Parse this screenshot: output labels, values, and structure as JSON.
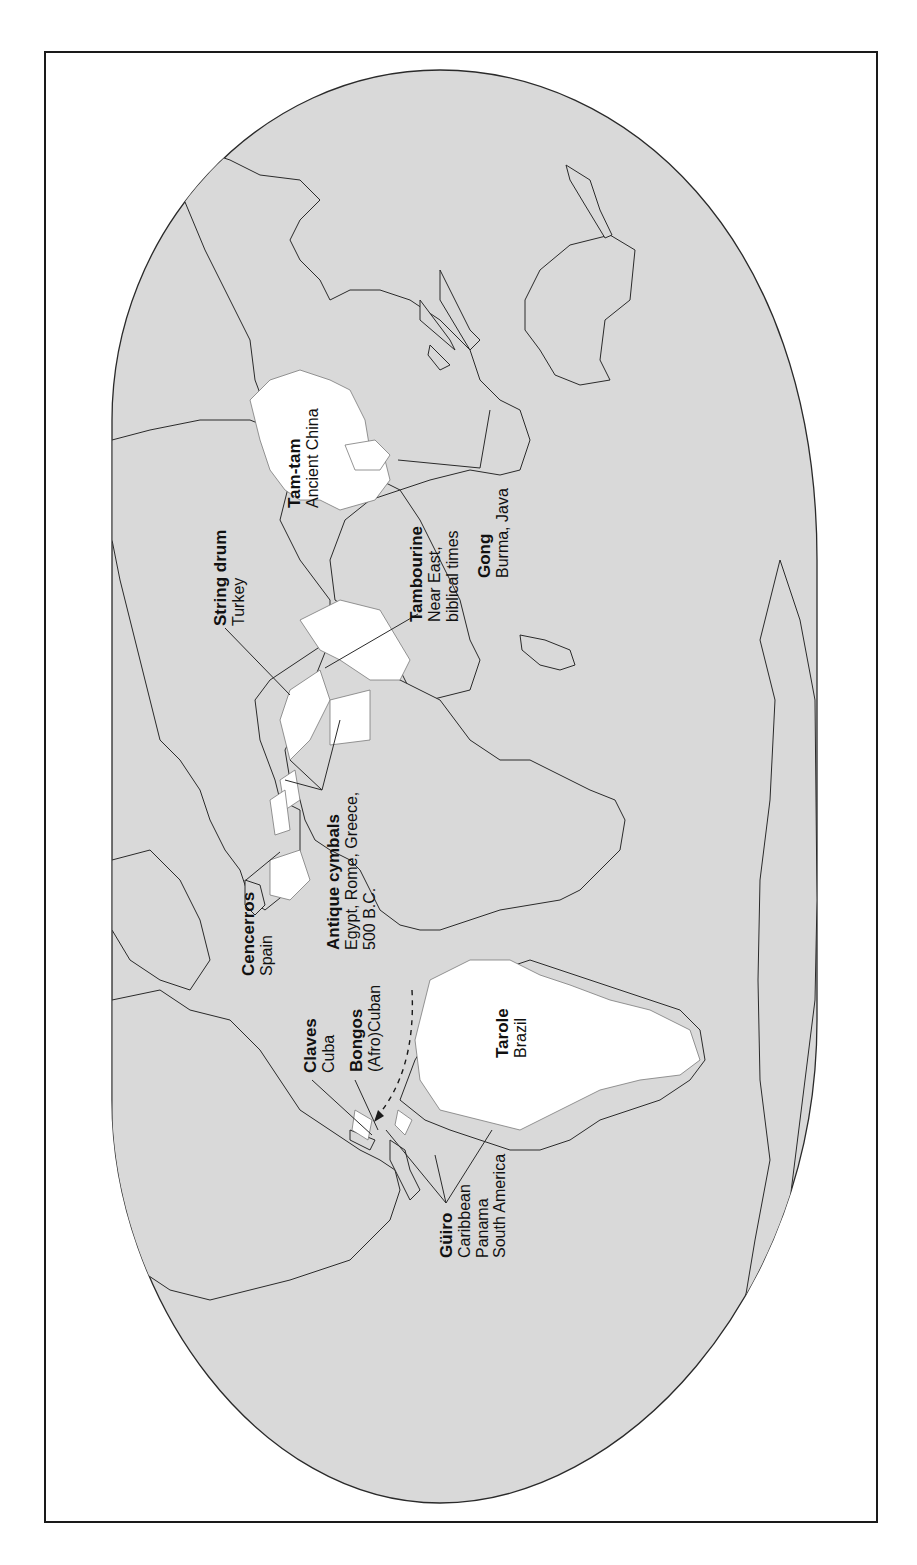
{
  "figure": {
    "edge_fragment": "s",
    "orientation": "rotated 90° counter-clockwise (north to the left)",
    "colors": {
      "ocean": "#d9d9d9",
      "land": "#d9d9d9",
      "highlight": "#ffffff",
      "outline": "#2a2a2a",
      "frame": "#1a1a1a"
    }
  },
  "labels": [
    {
      "id": "tam-tam",
      "name": "Tam-tam",
      "region": [
        "Ancient China"
      ]
    },
    {
      "id": "gong",
      "name": "Gong",
      "region": [
        "Burma, Java"
      ]
    },
    {
      "id": "string-drum",
      "name": "String drum",
      "region": [
        "Turkey"
      ]
    },
    {
      "id": "tambourine",
      "name": "Tambourine",
      "region": [
        "Near East,",
        "biblical times"
      ]
    },
    {
      "id": "antique-cymbals",
      "name": "Antique cymbals",
      "region": [
        "Egypt, Rome, Greece,",
        "500 B.C."
      ]
    },
    {
      "id": "cencerros",
      "name": "Cencerros",
      "region": [
        "Spain"
      ]
    },
    {
      "id": "claves",
      "name": "Claves",
      "region": [
        "Cuba"
      ]
    },
    {
      "id": "bongos",
      "name": "Bongos",
      "region": [
        "(Afro)Cuban"
      ]
    },
    {
      "id": "guiro",
      "name": "Güiro",
      "region": [
        "Caribbean",
        "Panama",
        "South America"
      ]
    },
    {
      "id": "tarole",
      "name": "Tarole",
      "region": [
        "Brazil"
      ]
    }
  ]
}
